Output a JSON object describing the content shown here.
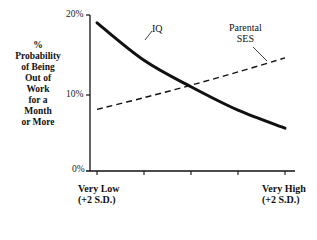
{
  "chart_data": {
    "type": "line",
    "title": "",
    "ylabel": "% Probability of Being Out of Work for a Month or More",
    "ylabel_lines": [
      "%",
      "Probability",
      "of Being",
      "Out of",
      "Work",
      "for a",
      "Month",
      "or More"
    ],
    "xlabel": "",
    "x_tick_labels": {
      "left": [
        "Very Low",
        "(+2 S.D.)"
      ],
      "right": [
        "Very High",
        "(+2 S.D.)"
      ]
    },
    "yticks": [
      "0%",
      "10%",
      "20%"
    ],
    "ylim": [
      0,
      20
    ],
    "x": [
      -2,
      -1,
      0,
      1,
      2
    ],
    "series": [
      {
        "name": "IQ",
        "style": "solid",
        "values": [
          19,
          14.2,
          10.8,
          7.8,
          5.5
        ]
      },
      {
        "name": "Parental SES",
        "style": "dashed",
        "values": [
          7.9,
          9.4,
          11.0,
          12.7,
          14.5
        ]
      }
    ],
    "annotations": [
      {
        "text": "IQ",
        "target": "IQ"
      },
      {
        "text": "Parental SES",
        "lines": [
          "Parental",
          "SES"
        ],
        "target": "Parental SES"
      }
    ],
    "grid": false,
    "legend": "none (inline annotations)"
  }
}
